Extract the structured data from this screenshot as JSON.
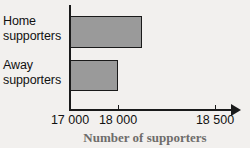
{
  "chart_data": {
    "type": "bar",
    "orientation": "horizontal",
    "title": "",
    "xlabel": "Number of supporters",
    "ylabel": "",
    "categories": [
      "Home supporters",
      "Away supporters"
    ],
    "values": [
      18500,
      18000
    ],
    "xlim": [
      17000,
      18700
    ],
    "xticks": [
      17000,
      18000,
      18500
    ],
    "xtick_labels": [
      "17 000",
      "18 000",
      "18 500"
    ],
    "grid": false,
    "legend": false,
    "bar_fill_color": "#9a9a9a",
    "bar_border_color": "#1a1a1a",
    "axis_color": "#1a1a1a",
    "axis_title_color": "#6e6c6a",
    "background_color": "#f2f0ee",
    "series": [
      {
        "name": "Supporters",
        "points": [
          {
            "category": "Home supporters",
            "label_line1": "Home",
            "label_line2": "supporters",
            "value": 18500
          },
          {
            "category": "Away supporters",
            "label_line1": "Away",
            "label_line2": "supporters",
            "value": 18000
          }
        ]
      }
    ]
  }
}
